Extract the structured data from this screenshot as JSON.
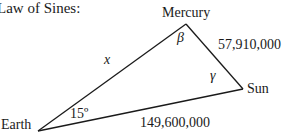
{
  "heading": "Law of Sines:",
  "vertices": {
    "mercury": "Mercury",
    "earth": "Earth",
    "sun": "Sun"
  },
  "sides": {
    "earth_mercury": "x",
    "mercury_sun": "57,910,000",
    "earth_sun": "149,600,000"
  },
  "angles": {
    "earth": "15º",
    "mercury": "β",
    "sun": "γ"
  },
  "colors": {
    "line": "#1a1a1a",
    "text": "#1a1a1a"
  }
}
